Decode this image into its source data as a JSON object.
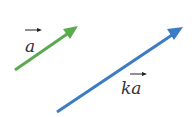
{
  "diagram": {
    "vectors": [
      {
        "name": "a",
        "label": "a",
        "color": "#5aab4f",
        "from": [
          15,
          70
        ],
        "to": [
          77,
          27
        ]
      },
      {
        "name": "ka",
        "label": "ka",
        "color": "#3b7cc4",
        "from": [
          57,
          112
        ],
        "to": [
          182,
          28
        ]
      }
    ]
  }
}
